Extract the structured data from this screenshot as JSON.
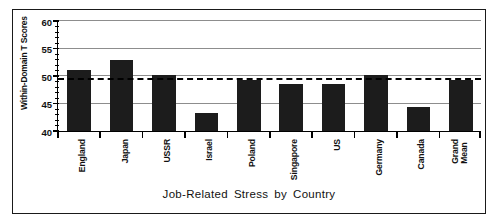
{
  "chart_data": {
    "type": "bar",
    "title": "",
    "xlabel": "Job-Related Stress by Country",
    "ylabel": "Within-Domain T Scores",
    "categories": [
      "England",
      "Japan",
      "USSR",
      "Israel",
      "Poland",
      "Singapore",
      "US",
      "Germany",
      "Canada",
      "Grand Mean"
    ],
    "values": [
      51.1,
      53.0,
      50.2,
      43.2,
      49.3,
      48.5,
      48.5,
      50.2,
      44.3,
      49.3
    ],
    "ylim": [
      40,
      60
    ],
    "ytick_labels": [
      "60",
      "55",
      "50",
      "45",
      "40"
    ],
    "ytick_values": [
      60,
      55,
      50,
      45,
      40
    ],
    "minor_tick_step": 1,
    "gridlines": [
      60,
      55,
      50,
      45
    ],
    "grid": true,
    "reference_line": {
      "value": 49.3,
      "style": "dashed",
      "label": "Grand Mean"
    },
    "legend": null,
    "bar_color": "#1c1c1c",
    "grid_color": "#8d8d8d",
    "axis_color": "#000000"
  },
  "figure": {
    "frame_color": "#1a1a1a",
    "background": "#ffffff"
  }
}
